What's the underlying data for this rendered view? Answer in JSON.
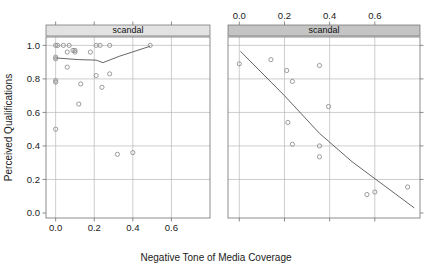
{
  "chart_data": {
    "type": "scatter",
    "title": "",
    "xlabel": "Negative Tone of Media Coverage",
    "ylabel": "Perceived Qualifications",
    "xlim": [
      -0.05,
      0.8
    ],
    "ylim": [
      -0.03,
      1.05
    ],
    "grid": true,
    "legend_position": "none",
    "panel_strip_labels": [
      "scandal",
      "scandal"
    ],
    "xticks": [
      0.0,
      0.2,
      0.4,
      0.6
    ],
    "xtick_labels": [
      "0.0",
      "0.2",
      "0.4",
      "0.6"
    ],
    "yticks": [
      0.0,
      0.2,
      0.4,
      0.6,
      0.8,
      1.0
    ],
    "ytick_labels": [
      "0.0",
      "0.2",
      "0.4",
      "0.6",
      "0.8",
      "1.0"
    ],
    "panels": [
      {
        "name": "no-scandal-panel",
        "strip_label": "scandal",
        "xaxis_labels_position": "bottom",
        "points": [
          {
            "x": 0.0,
            "y": 1.0
          },
          {
            "x": 0.01,
            "y": 1.0
          },
          {
            "x": 0.04,
            "y": 1.0
          },
          {
            "x": 0.07,
            "y": 1.0
          },
          {
            "x": 0.06,
            "y": 0.96
          },
          {
            "x": 0.09,
            "y": 0.97
          },
          {
            "x": 0.1,
            "y": 0.97
          },
          {
            "x": 0.1,
            "y": 0.96
          },
          {
            "x": 0.0,
            "y": 0.93
          },
          {
            "x": 0.0,
            "y": 0.92
          },
          {
            "x": 0.06,
            "y": 0.87
          },
          {
            "x": 0.0,
            "y": 0.79
          },
          {
            "x": 0.0,
            "y": 0.78
          },
          {
            "x": 0.13,
            "y": 0.77
          },
          {
            "x": 0.12,
            "y": 0.65
          },
          {
            "x": 0.0,
            "y": 0.5
          },
          {
            "x": 0.18,
            "y": 0.96
          },
          {
            "x": 0.21,
            "y": 1.0
          },
          {
            "x": 0.23,
            "y": 1.0
          },
          {
            "x": 0.28,
            "y": 1.0
          },
          {
            "x": 0.21,
            "y": 0.82
          },
          {
            "x": 0.28,
            "y": 0.83
          },
          {
            "x": 0.24,
            "y": 0.75
          },
          {
            "x": 0.32,
            "y": 0.35
          },
          {
            "x": 0.4,
            "y": 0.36
          },
          {
            "x": 0.49,
            "y": 1.0
          }
        ],
        "line": [
          {
            "x": 0.0,
            "y": 0.925
          },
          {
            "x": 0.12,
            "y": 0.915
          },
          {
            "x": 0.21,
            "y": 0.912
          },
          {
            "x": 0.245,
            "y": 0.897
          },
          {
            "x": 0.33,
            "y": 0.935
          },
          {
            "x": 0.49,
            "y": 0.995
          }
        ]
      },
      {
        "name": "scandal-panel",
        "strip_label": "scandal",
        "xaxis_labels_position": "top",
        "points": [
          {
            "x": 0.0,
            "y": 0.89
          },
          {
            "x": 0.14,
            "y": 0.915
          },
          {
            "x": 0.21,
            "y": 0.85
          },
          {
            "x": 0.235,
            "y": 0.785
          },
          {
            "x": 0.355,
            "y": 0.88
          },
          {
            "x": 0.395,
            "y": 0.635
          },
          {
            "x": 0.215,
            "y": 0.54
          },
          {
            "x": 0.235,
            "y": 0.41
          },
          {
            "x": 0.355,
            "y": 0.4
          },
          {
            "x": 0.355,
            "y": 0.335
          },
          {
            "x": 0.565,
            "y": 0.11
          },
          {
            "x": 0.6,
            "y": 0.125
          },
          {
            "x": 0.745,
            "y": 0.155
          }
        ],
        "line": [
          {
            "x": 0.005,
            "y": 0.965
          },
          {
            "x": 0.2,
            "y": 0.7
          },
          {
            "x": 0.355,
            "y": 0.475
          },
          {
            "x": 0.5,
            "y": 0.305
          },
          {
            "x": 0.775,
            "y": 0.03
          }
        ]
      }
    ]
  },
  "style": {
    "point_stroke": "#8a8a8a",
    "line_stroke": "#555555",
    "grid_color": "#b8b8b8",
    "axis_color": "#707070",
    "strip_fill_light": "#e2e2e2",
    "strip_fill_dark": "#c4c4c4",
    "strip_border": "#6a6a6a",
    "text_color": "#1a1a1a"
  }
}
